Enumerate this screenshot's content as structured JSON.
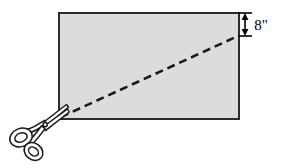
{
  "figure": {
    "name": "rectangle-cut-diagonally-with-scissors",
    "background_color": "#ffffff",
    "annotations": {
      "height_dimension": {
        "label": "8\"",
        "value": 8,
        "unit": "inch",
        "icon": "double-headed-vertical-arrow"
      }
    },
    "shapes": {
      "rectangle": {
        "name": "gray-rectangle",
        "fill_color": "#dcdcdc",
        "stroke_color": "#2b2b2b",
        "stroke_width": 2,
        "x": 58,
        "y": 12,
        "width": 182,
        "height": 108
      },
      "cut_line": {
        "name": "diagonal-dashed-cut-line",
        "stroke_color": "#1a1a1a",
        "stroke_width": 2.6,
        "dash_pattern": "8 5",
        "x1": 60,
        "y1": 118,
        "x2": 239,
        "y2": 36
      },
      "scissors": {
        "name": "scissors",
        "stroke_color": "#1a1a1a",
        "fill_color": "#ffffff",
        "pivot_x": 45,
        "pivot_y": 124
      },
      "dimension_arrow": {
        "name": "height-dimension-arrow",
        "stroke_color": "#000000",
        "x": 245,
        "y_top": 12,
        "y_bottom": 36,
        "tick_half_width": 7
      }
    }
  }
}
